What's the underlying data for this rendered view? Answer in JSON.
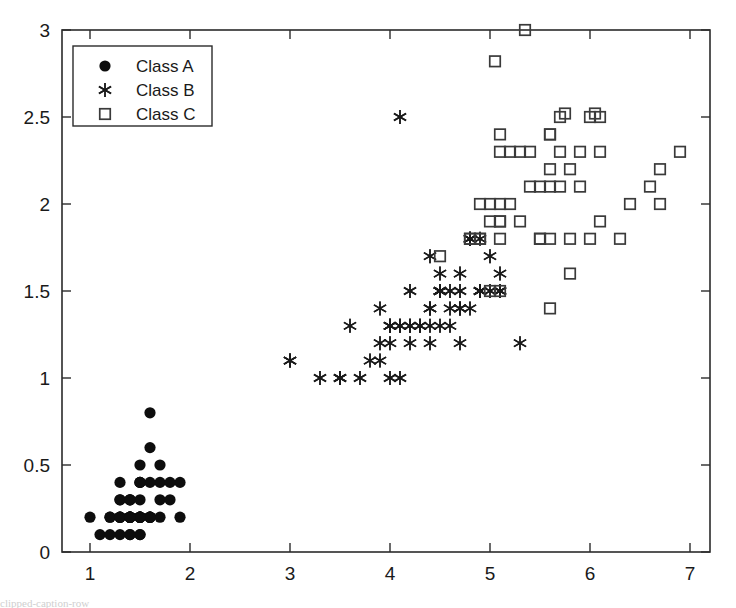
{
  "figure": {
    "background_color": "#ffffff",
    "axis_color": "#2b2b2b",
    "width": 736,
    "height": 608
  },
  "legend": {
    "position": "top-left",
    "entries": [
      {
        "label": "Class A",
        "marker": "filled-circle",
        "color": "#0d0d0d"
      },
      {
        "label": "Class B",
        "marker": "asterisk",
        "color": "#1a1a1a"
      },
      {
        "label": "Class C",
        "marker": "open-square",
        "color": "#3a3a3a"
      }
    ]
  },
  "caption": {
    "text": "clipped-caption-row"
  },
  "chart_data": {
    "type": "scatter",
    "title": "",
    "xlabel": "",
    "ylabel": "",
    "xlim": [
      0.72,
      7.2
    ],
    "ylim": [
      0,
      3
    ],
    "grid": false,
    "legend_position": "upper left",
    "xticks": [
      1,
      2,
      3,
      4,
      5,
      6,
      7
    ],
    "xtick_labels": [
      "1",
      "2",
      "3",
      "4",
      "5",
      "6",
      "7"
    ],
    "yticks": [
      0,
      0.5,
      1,
      1.5,
      2,
      2.5,
      3
    ],
    "ytick_labels": [
      "0",
      "0.5",
      "1",
      "1.5",
      "2",
      "2.5",
      "3"
    ],
    "series": [
      {
        "name": "Class A",
        "marker": "filled-circle",
        "color": "#0d0d0d",
        "points": [
          [
            1.4,
            0.2
          ],
          [
            1.4,
            0.2
          ],
          [
            1.3,
            0.2
          ],
          [
            1.5,
            0.2
          ],
          [
            1.4,
            0.2
          ],
          [
            1.7,
            0.4
          ],
          [
            1.4,
            0.3
          ],
          [
            1.5,
            0.2
          ],
          [
            1.4,
            0.2
          ],
          [
            1.5,
            0.1
          ],
          [
            1.5,
            0.2
          ],
          [
            1.6,
            0.2
          ],
          [
            1.4,
            0.1
          ],
          [
            1.1,
            0.1
          ],
          [
            1.2,
            0.2
          ],
          [
            1.5,
            0.4
          ],
          [
            1.3,
            0.4
          ],
          [
            1.4,
            0.3
          ],
          [
            1.7,
            0.3
          ],
          [
            1.5,
            0.3
          ],
          [
            1.7,
            0.2
          ],
          [
            1.5,
            0.4
          ],
          [
            1.0,
            0.2
          ],
          [
            1.7,
            0.5
          ],
          [
            1.9,
            0.2
          ],
          [
            1.6,
            0.2
          ],
          [
            1.6,
            0.4
          ],
          [
            1.5,
            0.2
          ],
          [
            1.4,
            0.2
          ],
          [
            1.6,
            0.2
          ],
          [
            1.6,
            0.2
          ],
          [
            1.5,
            0.4
          ],
          [
            1.5,
            0.1
          ],
          [
            1.4,
            0.2
          ],
          [
            1.5,
            0.2
          ],
          [
            1.2,
            0.2
          ],
          [
            1.3,
            0.2
          ],
          [
            1.4,
            0.1
          ],
          [
            1.3,
            0.2
          ],
          [
            1.5,
            0.2
          ],
          [
            1.3,
            0.3
          ],
          [
            1.3,
            0.3
          ],
          [
            1.3,
            0.2
          ],
          [
            1.6,
            0.6
          ],
          [
            1.9,
            0.4
          ],
          [
            1.4,
            0.3
          ],
          [
            1.6,
            0.2
          ],
          [
            1.4,
            0.2
          ],
          [
            1.5,
            0.2
          ],
          [
            1.4,
            0.2
          ],
          [
            1.6,
            0.8
          ],
          [
            1.5,
            0.5
          ],
          [
            1.8,
            0.4
          ],
          [
            1.8,
            0.3
          ],
          [
            1.3,
            0.1
          ],
          [
            1.2,
            0.1
          ]
        ]
      },
      {
        "name": "Class B",
        "marker": "asterisk",
        "color": "#1a1a1a",
        "points": [
          [
            4.7,
            1.4
          ],
          [
            4.5,
            1.5
          ],
          [
            4.9,
            1.5
          ],
          [
            4.0,
            1.3
          ],
          [
            4.6,
            1.5
          ],
          [
            4.5,
            1.3
          ],
          [
            4.7,
            1.6
          ],
          [
            3.3,
            1.0
          ],
          [
            4.6,
            1.3
          ],
          [
            3.9,
            1.4
          ],
          [
            3.5,
            1.0
          ],
          [
            4.2,
            1.5
          ],
          [
            4.0,
            1.0
          ],
          [
            4.7,
            1.4
          ],
          [
            3.6,
            1.3
          ],
          [
            4.4,
            1.4
          ],
          [
            4.5,
            1.5
          ],
          [
            4.1,
            1.0
          ],
          [
            4.5,
            1.5
          ],
          [
            3.9,
            1.1
          ],
          [
            4.8,
            1.8
          ],
          [
            4.0,
            1.3
          ],
          [
            4.9,
            1.5
          ],
          [
            4.7,
            1.2
          ],
          [
            4.3,
            1.3
          ],
          [
            4.4,
            1.4
          ],
          [
            4.8,
            1.4
          ],
          [
            5.0,
            1.7
          ],
          [
            4.5,
            1.5
          ],
          [
            3.5,
            1.0
          ],
          [
            3.8,
            1.1
          ],
          [
            3.7,
            1.0
          ],
          [
            3.9,
            1.2
          ],
          [
            5.1,
            1.6
          ],
          [
            4.5,
            1.5
          ],
          [
            4.5,
            1.6
          ],
          [
            4.7,
            1.5
          ],
          [
            4.4,
            1.3
          ],
          [
            4.1,
            1.3
          ],
          [
            4.0,
            1.3
          ],
          [
            4.4,
            1.2
          ],
          [
            4.6,
            1.4
          ],
          [
            4.0,
            1.2
          ],
          [
            3.0,
            1.1
          ],
          [
            4.2,
            1.3
          ],
          [
            4.2,
            1.2
          ],
          [
            4.2,
            1.3
          ],
          [
            4.3,
            1.3
          ],
          [
            3.0,
            1.1
          ],
          [
            4.1,
            1.3
          ],
          [
            4.1,
            2.5
          ],
          [
            4.4,
            1.7
          ],
          [
            5.1,
            1.5
          ],
          [
            4.9,
            1.5
          ],
          [
            4.8,
            1.8
          ],
          [
            4.8,
            1.8
          ],
          [
            5.3,
            1.2
          ],
          [
            4.9,
            1.8
          ],
          [
            5.1,
            1.5
          ],
          [
            5.0,
            1.5
          ]
        ]
      },
      {
        "name": "Class C",
        "marker": "open-square",
        "color": "#3a3a3a",
        "points": [
          [
            6.0,
            2.5
          ],
          [
            5.1,
            1.9
          ],
          [
            5.9,
            2.1
          ],
          [
            5.6,
            1.8
          ],
          [
            5.8,
            2.2
          ],
          [
            6.6,
            2.1
          ],
          [
            4.5,
            1.7
          ],
          [
            6.3,
            1.8
          ],
          [
            5.8,
            1.8
          ],
          [
            6.1,
            2.5
          ],
          [
            5.1,
            2.0
          ],
          [
            5.3,
            1.9
          ],
          [
            5.5,
            2.1
          ],
          [
            5.0,
            2.0
          ],
          [
            5.1,
            2.4
          ],
          [
            5.3,
            2.3
          ],
          [
            5.5,
            1.8
          ],
          [
            6.7,
            2.2
          ],
          [
            6.9,
            2.3
          ],
          [
            5.0,
            1.5
          ],
          [
            5.7,
            2.3
          ],
          [
            4.9,
            2.0
          ],
          [
            6.7,
            2.0
          ],
          [
            4.9,
            1.8
          ],
          [
            5.7,
            2.1
          ],
          [
            6.0,
            1.8
          ],
          [
            4.8,
            1.8
          ],
          [
            4.9,
            1.8
          ],
          [
            5.6,
            2.1
          ],
          [
            5.8,
            1.6
          ],
          [
            6.1,
            1.9
          ],
          [
            6.4,
            2.0
          ],
          [
            5.6,
            2.2
          ],
          [
            5.1,
            1.5
          ],
          [
            5.6,
            1.4
          ],
          [
            6.1,
            2.3
          ],
          [
            5.6,
            2.4
          ],
          [
            5.5,
            1.8
          ],
          [
            4.8,
            1.8
          ],
          [
            5.4,
            2.1
          ],
          [
            5.6,
            2.4
          ],
          [
            5.1,
            2.3
          ],
          [
            5.1,
            1.9
          ],
          [
            5.9,
            2.3
          ],
          [
            5.7,
            2.5
          ],
          [
            5.2,
            2.3
          ],
          [
            5.0,
            1.9
          ],
          [
            5.2,
            2.0
          ],
          [
            5.4,
            2.3
          ],
          [
            5.1,
            1.8
          ],
          [
            5.35,
            3.0
          ],
          [
            5.05,
            2.82
          ],
          [
            6.05,
            2.52
          ],
          [
            5.75,
            2.52
          ]
        ]
      }
    ]
  }
}
